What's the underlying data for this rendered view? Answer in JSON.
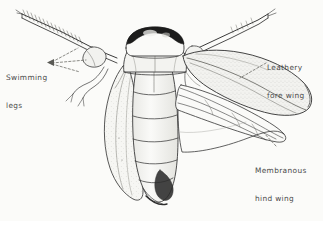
{
  "figure": {
    "type": "scientific-illustration",
    "background_color": "#fbfbf9",
    "ink_color": "#3a3a3a",
    "label_text_color": "#4a4a4a",
    "shade_color": "#c9c9c4",
    "dark_marking_color": "#1a1a1a"
  },
  "labels": [
    {
      "id": "swimming-legs",
      "line1": "Swimming",
      "line2": "legs",
      "position": "left",
      "leader": "dashed-with-arrowhead"
    },
    {
      "id": "leathery-fore-wing",
      "line1": "Leathery",
      "line2": "fore wing",
      "position": "right-top",
      "leader": "dashed"
    },
    {
      "id": "membranous-hind-wing",
      "line1": "Membranous",
      "line2": "hind wing",
      "position": "right-bottom",
      "leader": "dashed"
    }
  ],
  "parts": [
    {
      "name": "head",
      "description": "rounded head with dark curved eye band"
    },
    {
      "name": "pronotum",
      "description": "thorax shield behind head"
    },
    {
      "name": "abdomen",
      "description": "segmented elongate abdomen with transverse segment lines"
    },
    {
      "name": "left-fore-wing",
      "description": "leathery fore wing folded over left side"
    },
    {
      "name": "right-fore-wing",
      "description": "leathery fore wing spread to the right, stippled texture"
    },
    {
      "name": "hind-wing",
      "description": "membranous hind wing with radiating veins"
    },
    {
      "name": "left-swimming-leg",
      "description": "long fringed oar-like hind leg upper left"
    },
    {
      "name": "right-swimming-leg",
      "description": "long fringed oar-like hind leg upper right"
    },
    {
      "name": "middle-legs",
      "description": "shorter slender legs below the swimming legs"
    }
  ]
}
